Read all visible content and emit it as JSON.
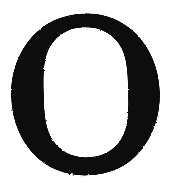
{
  "image": {
    "kind": "scanned-printed-character",
    "character": "O",
    "description": "Capital letter O in a serif typeface, scanned from print",
    "width": 169,
    "height": 184,
    "background_color": "#ffffff",
    "ink_color": "#0d0d0d",
    "script": "Latin",
    "case": "uppercase",
    "style": "serif-modulated-stroke"
  },
  "glyph": {
    "label": "O",
    "outer": {
      "center_x": 85.5,
      "center_y": 94.5,
      "radius_x": 74.5,
      "radius_y": 80.5,
      "left": 11,
      "right": 160,
      "top": 14,
      "bottom": 175
    },
    "counter": {
      "center_x": 86,
      "center_y": 92,
      "radius_x": 42,
      "radius_y": 65,
      "left": 44,
      "right": 128,
      "top": 27,
      "bottom": 157
    },
    "stroke_weights": {
      "left_side": 33,
      "right_side": 30,
      "top": 12,
      "bottom": 17
    },
    "rotation_deg": -1.5
  }
}
